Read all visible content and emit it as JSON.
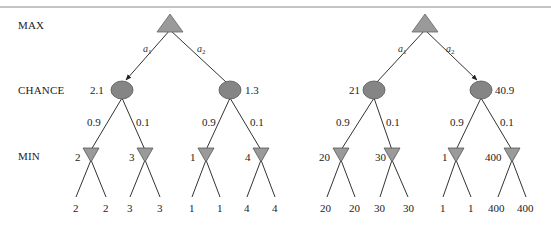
{
  "row_labels": {
    "max": "MAX",
    "chance": "CHANCE",
    "min": "MIN"
  },
  "colors": {
    "node_fill": "#9a9a9a",
    "chance_fill": "#858585",
    "edge": "#333333",
    "rule": "#8a8a8a"
  },
  "trees": [
    {
      "actions": [
        {
          "base": "a",
          "sub": "1"
        },
        {
          "base": "a",
          "sub": "2"
        }
      ],
      "chance_values": [
        "2.1",
        "1.3"
      ],
      "probs": [
        "0.9",
        "0.1",
        "0.9",
        "0.1"
      ],
      "min_values": [
        "2",
        "3",
        "1",
        "4"
      ],
      "leaves": [
        "2",
        "2",
        "3",
        "3",
        "1",
        "1",
        "4",
        "4"
      ],
      "chosen_action": "a1"
    },
    {
      "actions": [
        {
          "base": "a",
          "sub": "1"
        },
        {
          "base": "a",
          "sub": "2"
        }
      ],
      "chance_values": [
        "21",
        "40.9"
      ],
      "probs": [
        "0.9",
        "0.1",
        "0.9",
        "0.1"
      ],
      "min_values": [
        "20",
        "30",
        "1",
        "400"
      ],
      "leaves": [
        "20",
        "20",
        "30",
        "30",
        "1",
        "1",
        "400",
        "400"
      ],
      "chosen_action": "a2"
    }
  ]
}
